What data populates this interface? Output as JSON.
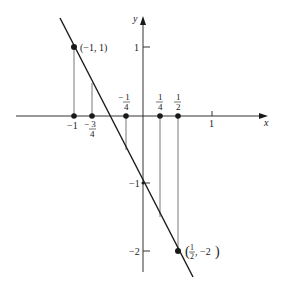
{
  "diagram": {
    "type": "function-graph",
    "axes": {
      "x_label": "x",
      "y_label": "y",
      "origin_px": [
        143,
        116
      ],
      "unit_px": 69
    },
    "line": {
      "description": "y = -2x - 1",
      "from": [
        -1.2,
        1.4
      ],
      "to": [
        0.72,
        -2.44
      ]
    },
    "x_ticks": [
      {
        "value": 1,
        "label": "1"
      }
    ],
    "y_ticks": [
      {
        "value": 1,
        "label": "1"
      },
      {
        "value": -1,
        "label": "−1"
      },
      {
        "value": -2,
        "label": "−2"
      }
    ],
    "x_points": [
      {
        "value": -1,
        "label_num": "−1",
        "label_den": "",
        "pos": "below"
      },
      {
        "value": -0.75,
        "label_num": "− 3",
        "label_den": "4",
        "pos": "below"
      },
      {
        "value": -0.25,
        "label_num": "− 1",
        "label_den": "4",
        "pos": "above"
      },
      {
        "value": 0.25,
        "label_num": "1",
        "label_den": "4",
        "pos": "above"
      },
      {
        "value": 0.5,
        "label_num": "1",
        "label_den": "2",
        "pos": "above"
      }
    ],
    "graph_points": [
      {
        "x": -1,
        "y": 1,
        "label": "(−1, 1)"
      },
      {
        "x": 0.5,
        "y": -2,
        "label": "(1/2, −2)"
      }
    ],
    "labels": {
      "point_a": "(−1, 1)",
      "point_b_open": "(",
      "point_b_num": "1",
      "point_b_den": "2",
      "point_b_rest": ", −2",
      "point_b_close": ")"
    },
    "colors": {
      "ink": "#1a1a1a",
      "thin": "#555555",
      "background": "#ffffff"
    }
  }
}
